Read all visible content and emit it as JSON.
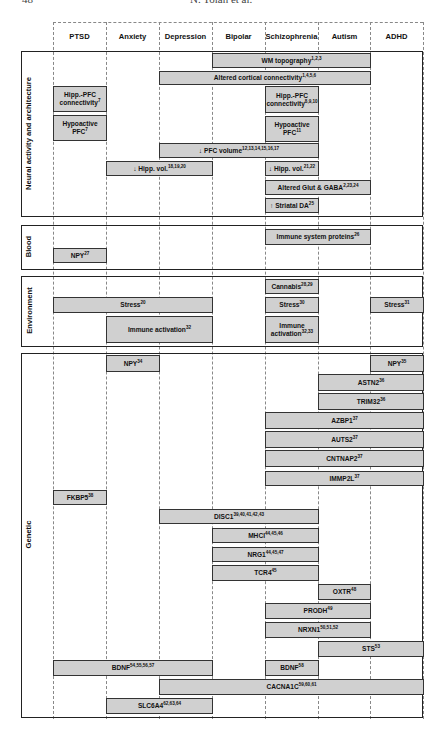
{
  "running_head": {
    "page_number": "48",
    "author": "N. Tolan et al."
  },
  "columns": [
    "PTSD",
    "Anxiety",
    "Depression",
    "Bipolar",
    "Schizophrenia",
    "Autism",
    "ADHD"
  ],
  "sections": [
    {
      "label": "Neural activity and architecture",
      "top": 51,
      "bottom": 215
    },
    {
      "label": "Blood",
      "top": 225,
      "bottom": 268
    },
    {
      "label": "Environment",
      "top": 276,
      "bottom": 345
    },
    {
      "label": "Genetic",
      "top": 353,
      "bottom": 716
    }
  ],
  "bars": [
    {
      "section": "Neural activity and architecture",
      "text": "WM topography",
      "refs": "1,2,3",
      "from": "Bipolar",
      "to": "Autism",
      "c0": 3,
      "c1": 6,
      "y0": 53,
      "y1": 68
    },
    {
      "section": "Neural activity and architecture",
      "text": "Altered cortical connectivity",
      "refs": "1,4,5,6",
      "from": "Depression",
      "to": "Autism",
      "c0": 2,
      "c1": 6,
      "y0": 71,
      "y1": 85
    },
    {
      "section": "Neural activity and architecture",
      "text": "Hipp.-PFC connectivity",
      "refs": "7",
      "from": "PTSD",
      "to": "PTSD",
      "c0": 0,
      "c1": 1,
      "y0": 86,
      "y1": 112
    },
    {
      "section": "Neural activity and architecture",
      "text": "Hypoactive PFC",
      "refs": "7",
      "from": "PTSD",
      "to": "PTSD",
      "c0": 0,
      "c1": 1,
      "y0": 115,
      "y1": 141
    },
    {
      "section": "Neural activity and architecture",
      "text": "Hipp.-PFC connectivity",
      "refs": "8,9,10",
      "from": "Schizophrenia",
      "to": "Schizophrenia",
      "c0": 4,
      "c1": 5,
      "y0": 86,
      "y1": 113
    },
    {
      "section": "Neural activity and architecture",
      "text": "Hypoactive PFC",
      "refs": "11",
      "from": "Schizophrenia",
      "to": "Schizophrenia",
      "c0": 4,
      "c1": 5,
      "y0": 116,
      "y1": 142
    },
    {
      "section": "Neural activity and architecture",
      "text": "↓ PFC volume",
      "refs": "12,13,14,15,16,17",
      "from": "Depression",
      "to": "Schizophrenia",
      "c0": 2,
      "c1": 5,
      "y0": 143,
      "y1": 158
    },
    {
      "section": "Neural activity and architecture",
      "text": "↓ Hipp. vol.",
      "refs": "18,19,20",
      "from": "Anxiety",
      "to": "Depression",
      "c0": 1,
      "c1": 3,
      "y0": 161,
      "y1": 176
    },
    {
      "section": "Neural activity and architecture",
      "text": "↓ Hipp. vol.",
      "refs": "21,22",
      "from": "Schizophrenia",
      "to": "Schizophrenia",
      "c0": 4,
      "c1": 5,
      "y0": 161,
      "y1": 176
    },
    {
      "section": "Neural activity and architecture",
      "text": "Altered Glut & GABA",
      "refs": "2,23,24",
      "from": "Schizophrenia",
      "to": "Autism",
      "c0": 4,
      "c1": 6,
      "y0": 180,
      "y1": 195
    },
    {
      "section": "Neural activity and architecture",
      "text": "↑ Striatal DA",
      "refs": "25",
      "from": "Schizophrenia",
      "to": "Schizophrenia",
      "c0": 4,
      "c1": 5,
      "y0": 198,
      "y1": 213
    },
    {
      "section": "Blood",
      "text": "Immune system proteins",
      "refs": "26",
      "from": "Schizophrenia",
      "to": "Autism",
      "c0": 4,
      "c1": 6,
      "y0": 229,
      "y1": 245
    },
    {
      "section": "Blood",
      "text": "NPY",
      "refs": "27",
      "from": "PTSD",
      "to": "PTSD",
      "c0": 0,
      "c1": 1,
      "y0": 248,
      "y1": 263
    },
    {
      "section": "Environment",
      "text": "Cannabis",
      "refs": "28,29",
      "from": "Schizophrenia",
      "to": "Schizophrenia",
      "c0": 4,
      "c1": 5,
      "y0": 279,
      "y1": 294
    },
    {
      "section": "Environment",
      "text": "Stress",
      "refs": "20",
      "from": "PTSD",
      "to": "Depression",
      "c0": 0,
      "c1": 3,
      "y0": 297,
      "y1": 313
    },
    {
      "section": "Environment",
      "text": "Stress",
      "refs": "30",
      "from": "Schizophrenia",
      "to": "Schizophrenia",
      "c0": 4,
      "c1": 5,
      "y0": 297,
      "y1": 313
    },
    {
      "section": "Environment",
      "text": "Stress",
      "refs": "31",
      "from": "ADHD",
      "to": "ADHD",
      "c0": 6,
      "c1": 7,
      "y0": 297,
      "y1": 313
    },
    {
      "section": "Environment",
      "text": "Immune activation",
      "refs": "32",
      "from": "Anxiety",
      "to": "Depression",
      "c0": 1,
      "c1": 3,
      "y0": 316,
      "y1": 343
    },
    {
      "section": "Environment",
      "text": "Immune activation",
      "refs": "32,33",
      "from": "Schizophrenia",
      "to": "Schizophrenia",
      "c0": 4,
      "c1": 5,
      "y0": 316,
      "y1": 343
    },
    {
      "section": "Genetic",
      "text": "NPY",
      "refs": "34",
      "from": "Anxiety",
      "to": "Anxiety",
      "c0": 1,
      "c1": 2,
      "y0": 355,
      "y1": 372
    },
    {
      "section": "Genetic",
      "text": "NPY",
      "refs": "35",
      "from": "ADHD",
      "to": "ADHD",
      "c0": 6,
      "c1": 7,
      "y0": 355,
      "y1": 372
    },
    {
      "section": "Genetic",
      "text": "ASTN2",
      "refs": "36",
      "from": "Autism",
      "to": "ADHD",
      "c0": 5,
      "c1": 7,
      "y0": 374,
      "y1": 391
    },
    {
      "section": "Genetic",
      "text": "TRIM32",
      "refs": "36",
      "from": "Autism",
      "to": "ADHD",
      "c0": 5,
      "c1": 7,
      "y0": 393,
      "y1": 410
    },
    {
      "section": "Genetic",
      "text": "AZBP1",
      "refs": "37",
      "from": "Schizophrenia",
      "to": "ADHD",
      "c0": 4,
      "c1": 7,
      "y0": 412,
      "y1": 429
    },
    {
      "section": "Genetic",
      "text": "AUTS2",
      "refs": "37",
      "from": "Schizophrenia",
      "to": "ADHD",
      "c0": 4,
      "c1": 7,
      "y0": 431,
      "y1": 448
    },
    {
      "section": "Genetic",
      "text": "CNTNAP2",
      "refs": "37",
      "from": "Schizophrenia",
      "to": "ADHD",
      "c0": 4,
      "c1": 7,
      "y0": 450,
      "y1": 467
    },
    {
      "section": "Genetic",
      "text": "IMMP2L",
      "refs": "37",
      "from": "Schizophrenia",
      "to": "ADHD",
      "c0": 4,
      "c1": 7,
      "y0": 471,
      "y1": 486
    },
    {
      "section": "Genetic",
      "text": "FKBP5",
      "refs": "38",
      "from": "PTSD",
      "to": "PTSD",
      "c0": 0,
      "c1": 1,
      "y0": 490,
      "y1": 505
    },
    {
      "section": "Genetic",
      "text": "DISC1",
      "refs": "39,40,41,42,43",
      "from": "Depression",
      "to": "Schizophrenia",
      "c0": 2,
      "c1": 5,
      "y0": 509,
      "y1": 524
    },
    {
      "section": "Genetic",
      "text": "MHCI",
      "refs": "44,45,46",
      "from": "Bipolar",
      "to": "Schizophrenia",
      "c0": 3,
      "c1": 5,
      "y0": 528,
      "y1": 543
    },
    {
      "section": "Genetic",
      "text": "NRG1",
      "refs": "44,45,47",
      "from": "Bipolar",
      "to": "Schizophrenia",
      "c0": 3,
      "c1": 5,
      "y0": 547,
      "y1": 562
    },
    {
      "section": "Genetic",
      "text": "TCR4",
      "refs": "45",
      "from": "Bipolar",
      "to": "Schizophrenia",
      "c0": 3,
      "c1": 5,
      "y0": 565,
      "y1": 581
    },
    {
      "section": "Genetic",
      "text": "OXTR",
      "refs": "48",
      "from": "Autism",
      "to": "Autism",
      "c0": 5,
      "c1": 6,
      "y0": 584,
      "y1": 600
    },
    {
      "section": "Genetic",
      "text": "PRODH",
      "refs": "49",
      "from": "Schizophrenia",
      "to": "Autism",
      "c0": 4,
      "c1": 6,
      "y0": 603,
      "y1": 619
    },
    {
      "section": "Genetic",
      "text": "NRXN1",
      "refs": "50,51,52",
      "from": "Schizophrenia",
      "to": "Autism",
      "c0": 4,
      "c1": 6,
      "y0": 622,
      "y1": 638
    },
    {
      "section": "Genetic",
      "text": "STS",
      "refs": "53",
      "from": "Autism",
      "to": "ADHD",
      "c0": 5,
      "c1": 7,
      "y0": 641,
      "y1": 657
    },
    {
      "section": "Genetic",
      "text": "BDNF",
      "refs": "54,55,56,57",
      "from": "PTSD",
      "to": "Depression",
      "c0": 0,
      "c1": 3,
      "y0": 660,
      "y1": 676
    },
    {
      "section": "Genetic",
      "text": "BDNF",
      "refs": "58",
      "from": "Schizophrenia",
      "to": "Schizophrenia",
      "c0": 4,
      "c1": 5,
      "y0": 660,
      "y1": 676
    },
    {
      "section": "Genetic",
      "text": "CACNA1C",
      "refs": "59,60,61",
      "from": "Depression",
      "to": "ADHD",
      "c0": 2,
      "c1": 7,
      "y0": 679,
      "y1": 695
    },
    {
      "section": "Genetic",
      "text": "SLC6A4",
      "refs": "62,63,64",
      "from": "Anxiety",
      "to": "Depression",
      "c0": 1,
      "c1": 3,
      "y0": 698,
      "y1": 714
    }
  ],
  "colors": {
    "bar_fill": "#d0d0d0",
    "bar_border": "#333333",
    "frame": "#222222",
    "gridline": "#888888"
  }
}
